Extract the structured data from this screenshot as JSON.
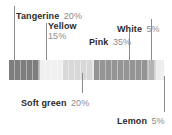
{
  "chart_data": {
    "type": "bar",
    "orientation": "horizontal-stacked",
    "title": "",
    "xlabel": "",
    "ylabel": "",
    "grid": false,
    "legend": "callout-labels",
    "total": 100,
    "unit": "%",
    "categories": [
      "Tangerine",
      "Yellow",
      "Soft green",
      "Pink",
      "White",
      "Lemon"
    ],
    "values": [
      20,
      15,
      20,
      35,
      5,
      5
    ],
    "labels": [
      "20%",
      "15%",
      "20%",
      "35%",
      "5%",
      "5%"
    ],
    "colors": [
      "#7e7e7e",
      "#f0f0f0",
      "#d8d8d8",
      "#949494",
      "#b4b4b4",
      "#ececec"
    ],
    "segments": [
      {
        "name": "Tangerine",
        "value": 20,
        "label": "20%",
        "color": "#7e7e7e"
      },
      {
        "name": "Yellow",
        "value": 15,
        "label": "15%",
        "color": "#f0f0f0"
      },
      {
        "name": "Soft green",
        "value": 20,
        "label": "20%",
        "color": "#d8d8d8"
      },
      {
        "name": "Pink",
        "value": 35,
        "label": "35%",
        "color": "#949494"
      },
      {
        "name": "White",
        "value": 5,
        "label": "5%",
        "color": "#b4b4b4"
      },
      {
        "name": "Lemon",
        "value": 5,
        "label": "5%",
        "color": "#ececec"
      }
    ]
  },
  "callouts": {
    "tangerine": {
      "name": "Tangerine",
      "pct": "20%"
    },
    "yellow": {
      "name": "Yellow",
      "pct": "15%"
    },
    "pink": {
      "name": "Pink",
      "pct": "35%"
    },
    "white": {
      "name": "White",
      "pct": "5%"
    },
    "soft_green": {
      "name": "Soft green",
      "pct": "20%"
    },
    "lemon": {
      "name": "Lemon",
      "pct": "5%"
    }
  }
}
